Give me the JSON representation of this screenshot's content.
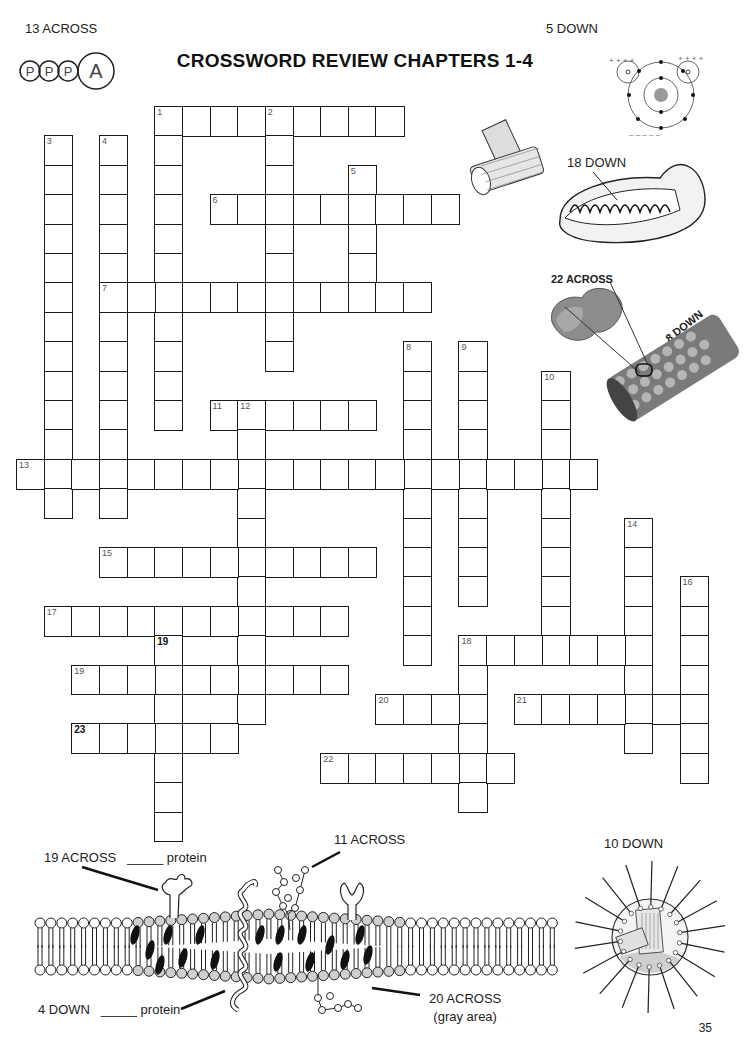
{
  "page": {
    "title": "CROSSWORD REVIEW CHAPTERS 1-4",
    "page_number": "35"
  },
  "image_labels": {
    "atp": "13 ACROSS",
    "atom": "5 DOWN",
    "mitochondrion": "18 DOWN",
    "protein_subunit": "22 ACROSS",
    "microtubule": "8 DOWN",
    "membrane_receptor": "19 ACROSS",
    "membrane_receptor_suffix": "_____ protein",
    "glycoprotein": "11 ACROSS",
    "integral": "4 DOWN",
    "integral_suffix": "_____ protein",
    "cholesterol": "20 ACROSS",
    "cholesterol_note": "(gray area)",
    "centrosome_cell": "10 DOWN"
  },
  "atp_letters": [
    "P",
    "P",
    "P",
    "A"
  ],
  "crossword": {
    "words": [
      {
        "num": "1",
        "dir": "across",
        "col": 5,
        "row": 0,
        "len": 9
      },
      {
        "num": "1",
        "dir": "down",
        "col": 5,
        "row": 0,
        "len": 11
      },
      {
        "num": "2",
        "dir": "down",
        "col": 9,
        "row": 0,
        "len": 9
      },
      {
        "num": "3",
        "dir": "down",
        "col": 1,
        "row": 1,
        "len": 13
      },
      {
        "num": "4",
        "dir": "down",
        "col": 3,
        "row": 1,
        "len": 13
      },
      {
        "num": "5",
        "dir": "down",
        "col": 12,
        "row": 2,
        "len": 5
      },
      {
        "num": "6",
        "dir": "across",
        "col": 7,
        "row": 3,
        "len": 9
      },
      {
        "num": "7",
        "dir": "across",
        "col": 3,
        "row": 6,
        "len": 12
      },
      {
        "num": "8",
        "dir": "down",
        "col": 14,
        "row": 8,
        "len": 11
      },
      {
        "num": "9",
        "dir": "down",
        "col": 16,
        "row": 8,
        "len": 9
      },
      {
        "num": "10",
        "dir": "down",
        "col": 19,
        "row": 9,
        "len": 10
      },
      {
        "num": "11",
        "dir": "across",
        "col": 7,
        "row": 10,
        "len": 6
      },
      {
        "num": "12",
        "dir": "down",
        "col": 8,
        "row": 10,
        "len": 11
      },
      {
        "num": "13",
        "dir": "across",
        "col": 0,
        "row": 12,
        "len": 21
      },
      {
        "num": "14",
        "dir": "down",
        "col": 22,
        "row": 14,
        "len": 8
      },
      {
        "num": "15",
        "dir": "across",
        "col": 3,
        "row": 15,
        "len": 10
      },
      {
        "num": "16",
        "dir": "down",
        "col": 24,
        "row": 16,
        "len": 7
      },
      {
        "num": "17",
        "dir": "across",
        "col": 1,
        "row": 17,
        "len": 11
      },
      {
        "num": "18",
        "dir": "across",
        "col": 16,
        "row": 18,
        "len": 7
      },
      {
        "num": "18",
        "dir": "down",
        "col": 16,
        "row": 18,
        "len": 6
      },
      {
        "num": "19",
        "dir": "down",
        "col": 5,
        "row": 18,
        "len": 7,
        "bold": true
      },
      {
        "num": "19",
        "dir": "across",
        "col": 2,
        "row": 19,
        "len": 10
      },
      {
        "num": "20",
        "dir": "across",
        "col": 13,
        "row": 20,
        "len": 4
      },
      {
        "num": "21",
        "dir": "across",
        "col": 18,
        "row": 20,
        "len": 7
      },
      {
        "num": "23",
        "dir": "across",
        "col": 2,
        "row": 21,
        "len": 6,
        "bold": true
      },
      {
        "num": "22",
        "dir": "across",
        "col": 11,
        "row": 22,
        "len": 7
      }
    ]
  },
  "colors": {
    "ink": "#1a1a1a",
    "gray_head": "#cfcfcf",
    "protein_light": "#b9b9b9",
    "protein_dark": "#6e6e6e"
  }
}
